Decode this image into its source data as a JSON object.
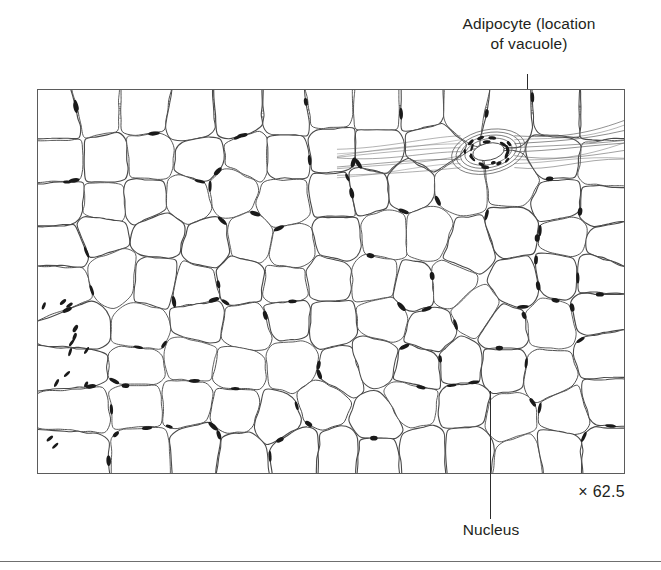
{
  "figure": {
    "type": "histology-micrograph",
    "magnification_label": "× 62.5",
    "frame": {
      "x": 37,
      "y": 89,
      "width": 588,
      "height": 385,
      "border_color": "#5b5b5b"
    },
    "bottom_rule_color": "#6f6f6f",
    "ink_color": "#231f20",
    "cell_outline_color": "#4a4a4a",
    "nucleus_color": "#1a1a1a",
    "background_color": "#ffffff"
  },
  "callouts": [
    {
      "id": "adipocyte",
      "label": "Adipocyte (location\nof vacuole)",
      "leader": {
        "x": 527,
        "y_top": 74,
        "y_bottom": 260
      }
    },
    {
      "id": "nucleus",
      "label": "Nucleus",
      "leader": {
        "x": 490,
        "y_top": 391,
        "y_bottom": 519
      }
    }
  ],
  "features": [
    {
      "name": "adipocyte-vacuole",
      "description": "Large rounded polygonal empty cells filling the field"
    },
    {
      "name": "nucleus",
      "description": "Small dark elongated profiles flattened at cell peripheries"
    },
    {
      "name": "capillary",
      "description": "Small vessel with clustered nuclei, upper-right of field"
    },
    {
      "name": "fibrous-septum",
      "description": "Striated connective tissue band along left edge and top edge"
    }
  ]
}
